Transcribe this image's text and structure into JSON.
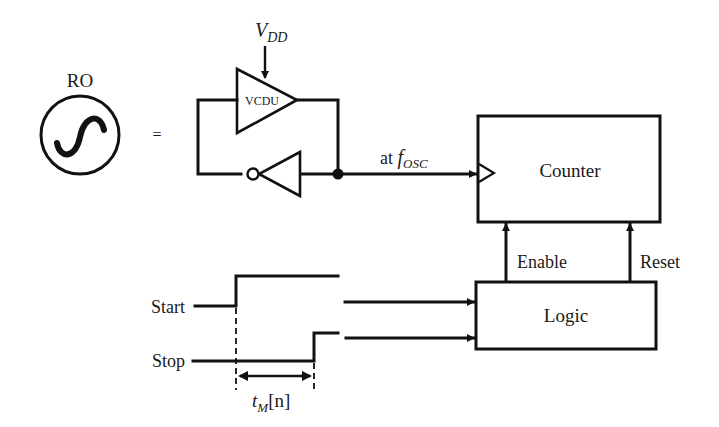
{
  "diagram": {
    "ro_symbol": {
      "label": "RO",
      "equals": "="
    },
    "oscillator": {
      "supply_label": {
        "main": "V",
        "sub": "DD"
      },
      "delay_unit_label": "VCDU",
      "output_label": {
        "prefix": "at ",
        "main": "f",
        "sub": "OSC"
      }
    },
    "counter": {
      "label": "Counter"
    },
    "logic": {
      "label": "Logic"
    },
    "control_signals": {
      "enable": "Enable",
      "reset": "Reset"
    },
    "waveforms": {
      "start_label": "Start",
      "stop_label": "Stop",
      "interval_label": {
        "main": "t",
        "sub": "M",
        "suffix": "[n]"
      }
    }
  }
}
